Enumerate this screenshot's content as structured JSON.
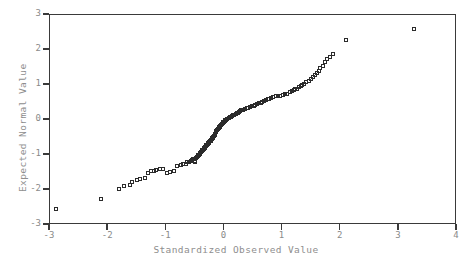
{
  "chart_data": {
    "type": "scatter",
    "title": "",
    "xlabel": "Standardized Observed Value",
    "ylabel": "Expected Normal Value",
    "xlim": [
      -3,
      4
    ],
    "ylim": [
      -3,
      3
    ],
    "xticks": [
      -3,
      -2,
      -1,
      0,
      1,
      2,
      3,
      4
    ],
    "yticks": [
      -3,
      -2,
      -1,
      0,
      1,
      2,
      3
    ],
    "xtick_labels": [
      "-3",
      "-2",
      "-1",
      "0",
      "1",
      "2",
      "3",
      "4"
    ],
    "ytick_labels": [
      "-3",
      "-2",
      "-1",
      "0",
      "1",
      "2",
      "3"
    ],
    "grid": false,
    "legend": null,
    "marker": "open-square",
    "marker_color": "#2b2b2b",
    "frame_color": "#3a3a3a",
    "text_color": "#8a8a8a",
    "series": [
      {
        "name": "Normal Q-Q",
        "points": [
          [
            -2.88,
            -2.57
          ],
          [
            -2.11,
            -2.26
          ],
          [
            -1.8,
            -1.98
          ],
          [
            -1.72,
            -1.9
          ],
          [
            -1.62,
            -1.86
          ],
          [
            -1.58,
            -1.78
          ],
          [
            -1.5,
            -1.74
          ],
          [
            -1.44,
            -1.7
          ],
          [
            -1.36,
            -1.66
          ],
          [
            -1.3,
            -1.52
          ],
          [
            -1.26,
            -1.48
          ],
          [
            -1.21,
            -1.46
          ],
          [
            -1.16,
            -1.44
          ],
          [
            -1.1,
            -1.42
          ],
          [
            -1.04,
            -1.4
          ],
          [
            -0.98,
            -1.52
          ],
          [
            -0.93,
            -1.5
          ],
          [
            -0.86,
            -1.48
          ],
          [
            -0.8,
            -1.32
          ],
          [
            -0.74,
            -1.3
          ],
          [
            -0.7,
            -1.28
          ],
          [
            -0.66,
            -1.26
          ],
          [
            -0.63,
            -1.22
          ],
          [
            -0.6,
            -1.2
          ],
          [
            -0.57,
            -1.18
          ],
          [
            -0.55,
            -1.16
          ],
          [
            -0.53,
            -1.13
          ],
          [
            -0.52,
            -1.14
          ],
          [
            -0.51,
            -1.12
          ],
          [
            -0.5,
            -1.2
          ],
          [
            -0.49,
            -1.18
          ],
          [
            -0.48,
            -1.1
          ],
          [
            -0.47,
            -1.08
          ],
          [
            -0.46,
            -1.06
          ],
          [
            -0.45,
            -1.04
          ],
          [
            -0.44,
            -1.02
          ],
          [
            -0.43,
            -1.0
          ],
          [
            -0.42,
            -0.98
          ],
          [
            -0.41,
            -0.96
          ],
          [
            -0.4,
            -0.94
          ],
          [
            -0.39,
            -0.92
          ],
          [
            -0.38,
            -0.9
          ],
          [
            -0.37,
            -0.88
          ],
          [
            -0.36,
            -0.86
          ],
          [
            -0.35,
            -0.84
          ],
          [
            -0.34,
            -0.82
          ],
          [
            -0.33,
            -0.8
          ],
          [
            -0.32,
            -0.78
          ],
          [
            -0.31,
            -0.76
          ],
          [
            -0.3,
            -0.74
          ],
          [
            -0.29,
            -0.72
          ],
          [
            -0.28,
            -0.7
          ],
          [
            -0.27,
            -0.68
          ],
          [
            -0.26,
            -0.66
          ],
          [
            -0.25,
            -0.64
          ],
          [
            -0.24,
            -0.62
          ],
          [
            -0.23,
            -0.6
          ],
          [
            -0.22,
            -0.58
          ],
          [
            -0.21,
            -0.56
          ],
          [
            -0.2,
            -0.54
          ],
          [
            -0.19,
            -0.52
          ],
          [
            -0.18,
            -0.5
          ],
          [
            -0.17,
            -0.48
          ],
          [
            -0.16,
            -0.44
          ],
          [
            -0.15,
            -0.4
          ],
          [
            -0.14,
            -0.36
          ],
          [
            -0.13,
            -0.33
          ],
          [
            -0.12,
            -0.3
          ],
          [
            -0.11,
            -0.28
          ],
          [
            -0.1,
            -0.26
          ],
          [
            -0.09,
            -0.24
          ],
          [
            -0.08,
            -0.22
          ],
          [
            -0.07,
            -0.2
          ],
          [
            -0.06,
            -0.18
          ],
          [
            -0.05,
            -0.16
          ],
          [
            -0.04,
            -0.14
          ],
          [
            -0.03,
            -0.12
          ],
          [
            -0.02,
            -0.1
          ],
          [
            -0.01,
            -0.08
          ],
          [
            0.0,
            -0.06
          ],
          [
            0.01,
            -0.04
          ],
          [
            0.02,
            -0.02
          ],
          [
            0.04,
            0.0
          ],
          [
            0.06,
            0.02
          ],
          [
            0.08,
            0.04
          ],
          [
            0.1,
            0.06
          ],
          [
            0.12,
            0.08
          ],
          [
            0.14,
            0.1
          ],
          [
            0.16,
            0.12
          ],
          [
            0.18,
            0.14
          ],
          [
            0.2,
            0.16
          ],
          [
            0.22,
            0.18
          ],
          [
            0.24,
            0.2
          ],
          [
            0.26,
            0.22
          ],
          [
            0.28,
            0.24
          ],
          [
            0.3,
            0.26
          ],
          [
            0.33,
            0.28
          ],
          [
            0.36,
            0.3
          ],
          [
            0.39,
            0.32
          ],
          [
            0.42,
            0.34
          ],
          [
            0.45,
            0.36
          ],
          [
            0.48,
            0.38
          ],
          [
            0.51,
            0.4
          ],
          [
            0.54,
            0.42
          ],
          [
            0.57,
            0.44
          ],
          [
            0.6,
            0.46
          ],
          [
            0.63,
            0.48
          ],
          [
            0.66,
            0.5
          ],
          [
            0.69,
            0.52
          ],
          [
            0.72,
            0.55
          ],
          [
            0.75,
            0.58
          ],
          [
            0.78,
            0.6
          ],
          [
            0.81,
            0.62
          ],
          [
            0.85,
            0.64
          ],
          [
            0.89,
            0.66
          ],
          [
            0.93,
            0.66
          ],
          [
            0.97,
            0.68
          ],
          [
            1.01,
            0.7
          ],
          [
            1.05,
            0.72
          ],
          [
            1.09,
            0.74
          ],
          [
            1.13,
            0.78
          ],
          [
            1.17,
            0.82
          ],
          [
            1.2,
            0.84
          ],
          [
            1.23,
            0.86
          ],
          [
            1.26,
            0.88
          ],
          [
            1.29,
            0.92
          ],
          [
            1.32,
            0.96
          ],
          [
            1.35,
            1.0
          ],
          [
            1.38,
            1.02
          ],
          [
            1.42,
            1.06
          ],
          [
            1.46,
            1.1
          ],
          [
            1.5,
            1.16
          ],
          [
            1.54,
            1.22
          ],
          [
            1.57,
            1.26
          ],
          [
            1.6,
            1.34
          ],
          [
            1.63,
            1.4
          ],
          [
            1.66,
            1.46
          ],
          [
            1.7,
            1.52
          ],
          [
            1.74,
            1.64
          ],
          [
            1.78,
            1.72
          ],
          [
            1.82,
            1.78
          ],
          [
            1.88,
            1.86
          ],
          [
            2.1,
            2.26
          ],
          [
            3.27,
            2.6
          ]
        ]
      }
    ]
  }
}
